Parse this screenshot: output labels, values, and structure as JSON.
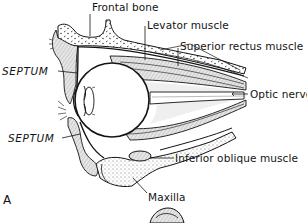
{
  "figure": {
    "panel_letter": "A",
    "labels": {
      "frontal_bone": "Frontal bone",
      "levator_muscle": "Levator muscle",
      "superior_rectus_muscle": "Superior rectus muscle",
      "septum_upper": "SEPTUM",
      "optic_nerve": "Optic nerve",
      "septum_lower": "SEPTUM",
      "inferior_oblique_muscle": "Inferior oblique muscle",
      "maxilla": "Maxilla"
    },
    "colors": {
      "ink": "#141414",
      "shade": "#c8c8c8",
      "paper": "#ffffff"
    }
  }
}
